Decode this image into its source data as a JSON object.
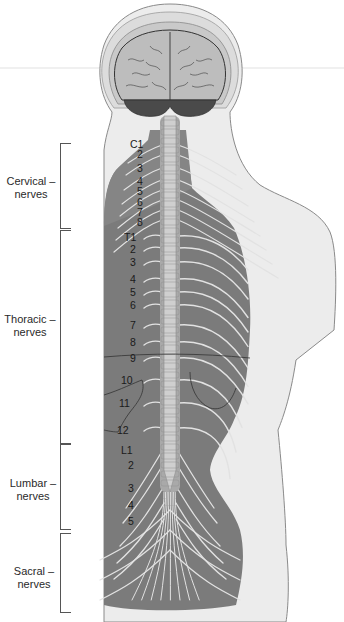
{
  "diagram": {
    "groups": [
      {
        "id": "cervical",
        "line1": "Cervical",
        "line2": "nerves",
        "labels": [
          "C1",
          "2",
          "3",
          "4",
          "5",
          "6",
          "7",
          "8"
        ]
      },
      {
        "id": "thoracic",
        "line1": "Thoracic",
        "line2": "nerves",
        "labels": [
          "T1",
          "2",
          "3",
          "4",
          "5",
          "6",
          "7",
          "8",
          "9",
          "10",
          "11",
          "12"
        ]
      },
      {
        "id": "lumbar",
        "line1": "Lumbar",
        "line2": "nerves",
        "labels": [
          "L1",
          "2",
          "3",
          "4",
          "5"
        ]
      },
      {
        "id": "sacral",
        "line1": "Sacral",
        "line2": "nerves",
        "labels": []
      }
    ],
    "colors": {
      "background": "#ffffff",
      "skin": "#e9e9e9",
      "skin_outline": "#8a8a8a",
      "back_muscle": "#7a7a7a",
      "back_muscle_dark": "#6e6e6e",
      "brain": "#c4c4c4",
      "cerebellum": "#4a4a4a",
      "nerve": "#e2e2e2",
      "spinal_cord": "#bdbdbd",
      "label_text": "#1a1a1a",
      "bracket": "#555555"
    }
  }
}
